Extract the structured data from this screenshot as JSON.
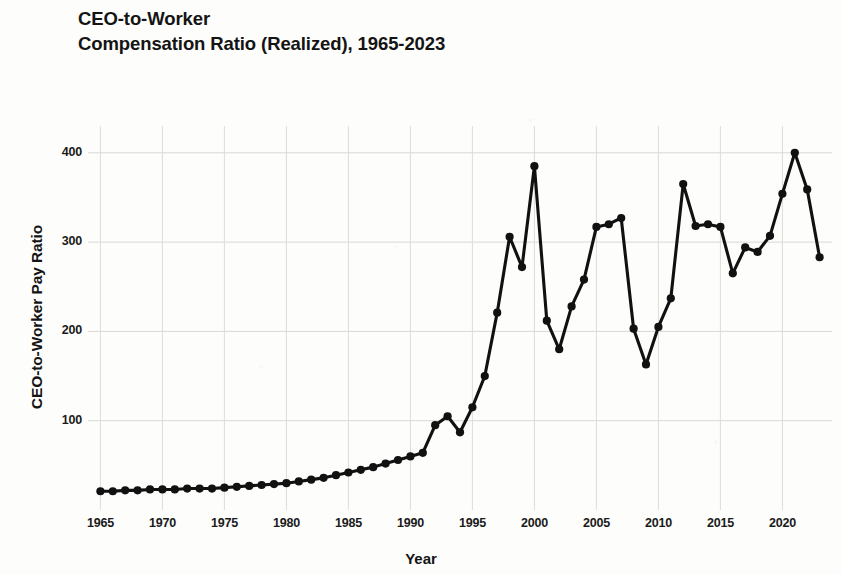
{
  "chart_data": {
    "type": "line",
    "title": "CEO-to-Worker\nCompensation Ratio (Realized), 1965-2023",
    "title_line1": "CEO-to-Worker",
    "title_line2": "Compensation Ratio (Realized), 1965-2023",
    "xlabel": "Year",
    "ylabel": "CEO-to-Worker Pay Ratio",
    "grid": true,
    "legend": "none",
    "line_color": "#111111",
    "marker": "circle",
    "xlim": [
      1964,
      2024
    ],
    "ylim": [
      0,
      430
    ],
    "xticks": [
      1965,
      1970,
      1975,
      1980,
      1985,
      1990,
      1995,
      2000,
      2005,
      2010,
      2015,
      2020
    ],
    "yticks": [
      100,
      200,
      300,
      400
    ],
    "x": [
      1965,
      1966,
      1967,
      1968,
      1969,
      1970,
      1971,
      1972,
      1973,
      1974,
      1975,
      1976,
      1977,
      1978,
      1979,
      1980,
      1981,
      1982,
      1983,
      1984,
      1985,
      1986,
      1987,
      1988,
      1989,
      1990,
      1991,
      1992,
      1993,
      1994,
      1995,
      1996,
      1997,
      1998,
      1999,
      2000,
      2001,
      2002,
      2003,
      2004,
      2005,
      2006,
      2007,
      2008,
      2009,
      2010,
      2011,
      2012,
      2013,
      2014,
      2015,
      2016,
      2017,
      2018,
      2019,
      2020,
      2021,
      2022,
      2023
    ],
    "values": [
      21,
      21,
      22,
      22,
      23,
      23,
      23,
      24,
      24,
      24,
      25,
      26,
      27,
      28,
      29,
      30,
      32,
      34,
      36,
      39,
      42,
      45,
      48,
      52,
      56,
      60,
      64,
      95,
      105,
      87,
      115,
      150,
      221,
      306,
      272,
      385,
      212,
      180,
      228,
      258,
      317,
      320,
      327,
      203,
      163,
      205,
      237,
      365,
      318,
      320,
      317,
      265,
      294,
      289,
      307,
      354,
      400,
      359,
      283
    ]
  }
}
